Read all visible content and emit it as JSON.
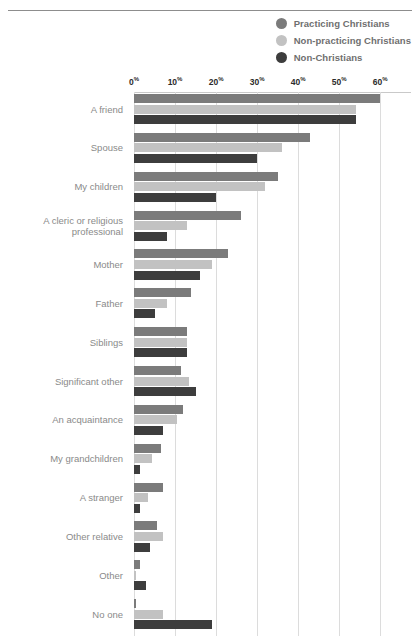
{
  "top_caption": "",
  "legend": {
    "items": [
      {
        "label": "Practicing Christians",
        "color": "#7b7b7b",
        "icon": "circle-icon"
      },
      {
        "label": "Non-practicing Christians",
        "color": "#c2c2c2",
        "icon": "circle-icon"
      },
      {
        "label": "Non-Christians",
        "color": "#3d3d3d",
        "icon": "circle-icon"
      }
    ]
  },
  "axis": {
    "ticks": [
      "0",
      "10",
      "20",
      "30",
      "40",
      "50",
      "60"
    ],
    "suffix": "%"
  },
  "chart_data": {
    "type": "bar",
    "orientation": "horizontal",
    "title": "",
    "xlabel": "",
    "ylabel": "",
    "xlim": [
      0,
      67.5
    ],
    "grid": true,
    "legend_position": "top-right",
    "tick_values": [
      0,
      10,
      20,
      30,
      40,
      50,
      60
    ],
    "tick_labels": [
      "0%",
      "10%",
      "20%",
      "30%",
      "40%",
      "50%",
      "60%"
    ],
    "categories": [
      "A friend",
      "Spouse",
      "My children",
      "A cleric or religious\nprofessional",
      "Mother",
      "Father",
      "Siblings",
      "Significant other",
      "An acquaintance",
      "My grandchildren",
      "A stranger",
      "Other relative",
      "Other",
      "No one"
    ],
    "series": [
      {
        "name": "Practicing Christians",
        "color": "#7b7b7b",
        "values": [
          60,
          43,
          35,
          26,
          23,
          14,
          13,
          11.5,
          12,
          6.5,
          7,
          5.5,
          1.5,
          0.5
        ]
      },
      {
        "name": "Non-practicing Christians",
        "color": "#c2c2c2",
        "values": [
          54,
          36,
          32,
          13,
          19,
          8,
          13,
          13.5,
          10.5,
          4.5,
          3.5,
          7,
          0.5,
          7
        ]
      },
      {
        "name": "Non-Christians",
        "color": "#3d3d3d",
        "values": [
          54,
          30,
          20,
          8,
          16,
          5,
          13,
          15,
          7,
          1.5,
          1.5,
          4,
          3,
          19
        ]
      }
    ]
  }
}
